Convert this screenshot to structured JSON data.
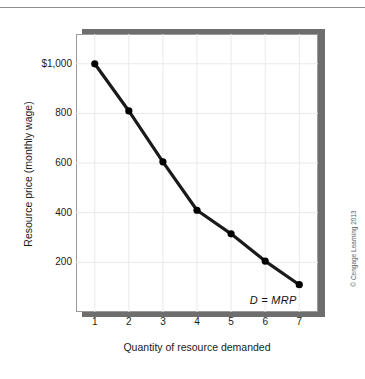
{
  "figure": {
    "credit": "© Cengage Learning 2013",
    "curve_annotation": "D = MRP"
  },
  "colors": {
    "line": "#1a1a1a",
    "marker": "#000000",
    "gridline": "#e9e9e9",
    "plot_border": "#9a9a9a",
    "shadow": "#6e6e6e",
    "text": "#1a1a1a",
    "top_rule": "#8e8e8e"
  },
  "chart_data": {
    "type": "line",
    "title": "",
    "xlabel": "Quantity of resource demanded",
    "ylabel": "Resource price (monthly wage)",
    "x": [
      1,
      2,
      3,
      4,
      5,
      6,
      7
    ],
    "values": [
      1000,
      810,
      605,
      410,
      315,
      205,
      110
    ],
    "xticklabels": [
      "1",
      "2",
      "3",
      "4",
      "5",
      "6",
      "7"
    ],
    "yticks": [
      1000,
      800,
      600,
      400,
      200
    ],
    "yticklabels": [
      "$1,000",
      "800",
      "600",
      "400",
      "200"
    ],
    "xlim": [
      0.45,
      7.55
    ],
    "ylim": [
      0,
      1120
    ],
    "grid": "vertical-only",
    "legend": "none",
    "annotations": [
      {
        "text": "D = MRP",
        "x": 6.25,
        "y": 45,
        "style": "italic"
      }
    ],
    "series": [
      {
        "name": "D = MRP",
        "marker": "filled-circle",
        "points": [
          {
            "x": 1,
            "y": 1000
          },
          {
            "x": 2,
            "y": 810
          },
          {
            "x": 3,
            "y": 605
          },
          {
            "x": 4,
            "y": 410
          },
          {
            "x": 5,
            "y": 315
          },
          {
            "x": 6,
            "y": 205
          },
          {
            "x": 7,
            "y": 110
          }
        ]
      }
    ]
  }
}
